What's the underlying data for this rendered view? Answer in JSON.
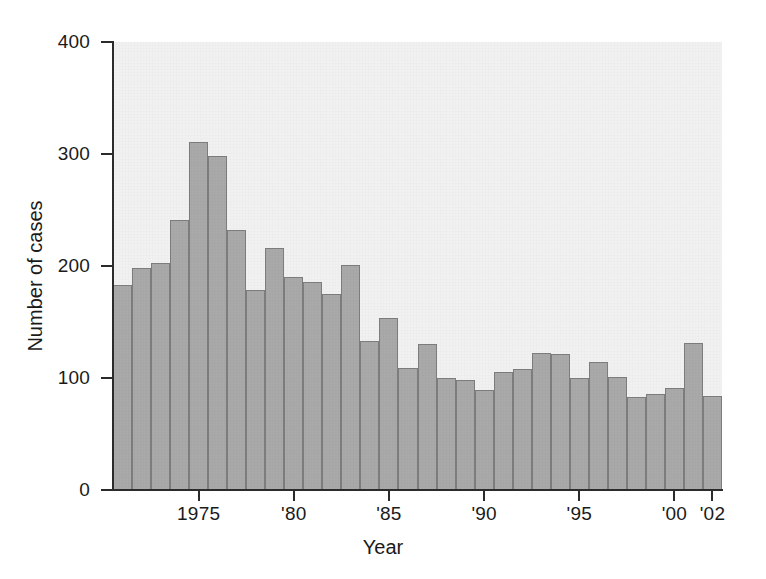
{
  "chart_data": {
    "type": "bar",
    "title": "",
    "xlabel": "Year",
    "ylabel": "Number of cases",
    "ylim": [
      0,
      400
    ],
    "xlim": [
      1970.5,
      2002.5
    ],
    "grid": false,
    "legend": null,
    "y_ticks": [
      0,
      100,
      200,
      300,
      400
    ],
    "y_tick_labels": [
      "0",
      "100",
      "200",
      "300",
      "400"
    ],
    "x_ticks": [
      1975,
      1980,
      1985,
      1990,
      1995,
      2000,
      2002
    ],
    "x_tick_labels": [
      "1975",
      "'80",
      "'85",
      "'90",
      "'95",
      "'00",
      "'02"
    ],
    "categories": [
      1971,
      1972,
      1973,
      1974,
      1975,
      1976,
      1977,
      1978,
      1979,
      1980,
      1981,
      1982,
      1983,
      1984,
      1985,
      1986,
      1987,
      1988,
      1989,
      1990,
      1991,
      1992,
      1993,
      1994,
      1995,
      1996,
      1997,
      1998,
      1999,
      2000,
      2001,
      2002
    ],
    "values": [
      183,
      198,
      203,
      241,
      311,
      298,
      232,
      179,
      216,
      190,
      186,
      175,
      201,
      133,
      154,
      109,
      130,
      100,
      98,
      89,
      105,
      108,
      122,
      121,
      100,
      114,
      101,
      83,
      86,
      91,
      131,
      84
    ],
    "colors": {
      "bar_fill": "#a9a9a9",
      "bar_edge": "#7d7d7d",
      "panel_background": "#f1f1f1",
      "axis": "#2b2b2b",
      "text": "#1a1a1a",
      "figure_background": "#ffffff"
    }
  }
}
